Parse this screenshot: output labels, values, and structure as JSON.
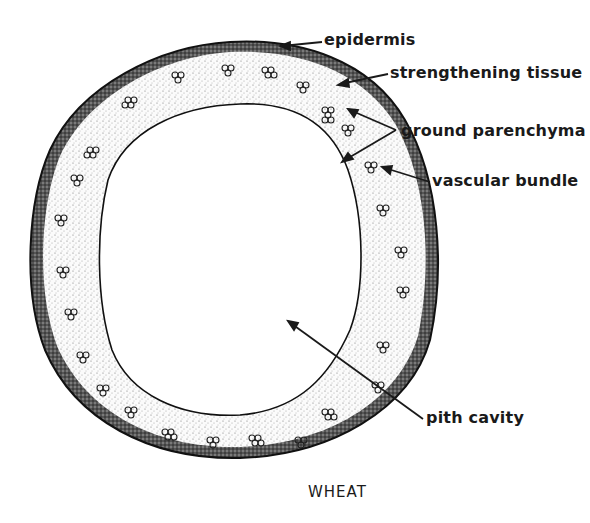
{
  "diagram": {
    "title": "WHEAT",
    "labels": {
      "epidermis": "epidermis",
      "strengthening_tissue": "strengthening tissue",
      "ground_parenchyma": "ground parenchyma",
      "vascular_bundle": "vascular bundle",
      "pith_cavity": "pith cavity"
    },
    "colors": {
      "ink": "#1a1a1a",
      "background": "#ffffff",
      "tissue_stipple": "#d8d8d8"
    }
  }
}
